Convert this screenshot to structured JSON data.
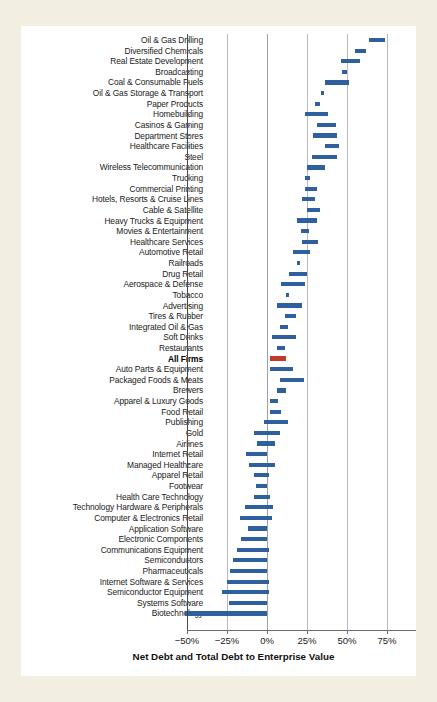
{
  "figure": {
    "background_color": "#f2efe2",
    "panel_color": "#ffffff",
    "bar_color": "#2e5f9e",
    "accent_color": "#c0392b",
    "gridline_color": "#b9b9c4"
  },
  "chart_data": {
    "type": "bar",
    "subtype": "horizontal-floating-range-bar",
    "title": "",
    "xlabel": "Net Debt and Total Debt to Enterprise Value",
    "ylabel": "",
    "xlim": [
      -57,
      80
    ],
    "xticks": [
      -50,
      -25,
      0,
      25,
      50,
      75
    ],
    "xticklabels": [
      "−50%",
      "−25%",
      "0%",
      "25%",
      "50%",
      "75%"
    ],
    "grid": "vertical",
    "legend": "none",
    "value_unit": "percent",
    "series": [
      {
        "name": "Net Debt to Enterprise Value",
        "role": "bar-start"
      },
      {
        "name": "Total Debt to Enterprise Value",
        "role": "bar-end"
      }
    ],
    "highlight_category": "All Firms",
    "categories": [
      "Oil & Gas Drilling",
      "Diversified Chemicals",
      "Real Estate Development",
      "Broadcasting",
      "Coal & Consumable Fuels",
      "Oil & Gas Storage & Transport",
      "Paper Products",
      "Homebuilding",
      "Casinos & Gaming",
      "Department Stores",
      "Healthcare Facilities",
      "Steel",
      "Wireless Telecommunication",
      "Trucking",
      "Commercial Printing",
      "Hotels, Resorts & Cruise Lines",
      "Cable & Satellite",
      "Heavy Trucks & Equipment",
      "Movies & Entertainment",
      "Healthcare Services",
      "Automotive Retail",
      "Railroads",
      "Drug Retail",
      "Aerospace & Defense",
      "Tobacco",
      "Advertising",
      "Tires & Rubber",
      "Integrated Oil & Gas",
      "Soft Drinks",
      "Restaurants",
      "All Firms",
      "Auto Parts & Equipment",
      "Packaged Foods & Meats",
      "Brewers",
      "Apparel & Luxury Goods",
      "Food Retail",
      "Publishing",
      "Gold",
      "Airlines",
      "Internet Retail",
      "Managed Healthcare",
      "Apparel Retail",
      "Footwear",
      "Health Care Technology",
      "Technology Hardware & Peripherals",
      "Computer & Electronics Retail",
      "Application Software",
      "Electronic Components",
      "Communications Equipment",
      "Semiconductors",
      "Pharmaceuticals",
      "Internet Software & Services",
      "Semiconductor Equipment",
      "Systems Software",
      "Biotechnology"
    ],
    "ranges": [
      {
        "category": "Oil & Gas Drilling",
        "start": 64,
        "end": 74
      },
      {
        "category": "Diversified Chemicals",
        "start": 55,
        "end": 62
      },
      {
        "category": "Real Estate Development",
        "start": 46,
        "end": 58
      },
      {
        "category": "Broadcasting",
        "start": 47,
        "end": 50
      },
      {
        "category": "Coal & Consumable Fuels",
        "start": 36,
        "end": 51
      },
      {
        "category": "Oil & Gas Storage & Transport",
        "start": 34,
        "end": 35
      },
      {
        "category": "Paper Products",
        "start": 30,
        "end": 33
      },
      {
        "category": "Homebuilding",
        "start": 24,
        "end": 38
      },
      {
        "category": "Casinos & Gaming",
        "start": 31,
        "end": 43
      },
      {
        "category": "Department Stores",
        "start": 29,
        "end": 44
      },
      {
        "category": "Healthcare Facilities",
        "start": 36,
        "end": 45
      },
      {
        "category": "Steel",
        "start": 28,
        "end": 44
      },
      {
        "category": "Wireless Telecommunication",
        "start": 25,
        "end": 36
      },
      {
        "category": "Trucking",
        "start": 24,
        "end": 27
      },
      {
        "category": "Commercial Printing",
        "start": 24,
        "end": 31
      },
      {
        "category": "Hotels, Resorts & Cruise Lines",
        "start": 22,
        "end": 30
      },
      {
        "category": "Cable & Satellite",
        "start": 25,
        "end": 33
      },
      {
        "category": "Heavy Trucks & Equipment",
        "start": 19,
        "end": 31
      },
      {
        "category": "Movies & Entertainment",
        "start": 21,
        "end": 26
      },
      {
        "category": "Healthcare Services",
        "start": 22,
        "end": 32
      },
      {
        "category": "Automotive Retail",
        "start": 16,
        "end": 27
      },
      {
        "category": "Railroads",
        "start": 19,
        "end": 20
      },
      {
        "category": "Drug Retail",
        "start": 14,
        "end": 25
      },
      {
        "category": "Aerospace & Defense",
        "start": 9,
        "end": 24
      },
      {
        "category": "Tobacco",
        "start": 12,
        "end": 14
      },
      {
        "category": "Advertising",
        "start": 6,
        "end": 22
      },
      {
        "category": "Tires & Rubber",
        "start": 11,
        "end": 18
      },
      {
        "category": "Integrated Oil & Gas",
        "start": 8,
        "end": 13
      },
      {
        "category": "Soft Drinks",
        "start": 3,
        "end": 18
      },
      {
        "category": "Restaurants",
        "start": 6,
        "end": 11
      },
      {
        "category": "All Firms",
        "start": 2,
        "end": 12
      },
      {
        "category": "Auto Parts & Equipment",
        "start": 2,
        "end": 16
      },
      {
        "category": "Packaged Foods & Meats",
        "start": 8,
        "end": 23
      },
      {
        "category": "Brewers",
        "start": 6,
        "end": 12
      },
      {
        "category": "Apparel & Luxury Goods",
        "start": 2,
        "end": 7
      },
      {
        "category": "Food Retail",
        "start": 2,
        "end": 9
      },
      {
        "category": "Publishing",
        "start": -2,
        "end": 13
      },
      {
        "category": "Gold",
        "start": -8,
        "end": 8
      },
      {
        "category": "Airlines",
        "start": -6,
        "end": 5
      },
      {
        "category": "Internet Retail",
        "start": -13,
        "end": 0
      },
      {
        "category": "Managed Healthcare",
        "start": -11,
        "end": 5
      },
      {
        "category": "Apparel Retail",
        "start": -8,
        "end": 1
      },
      {
        "category": "Footwear",
        "start": -7,
        "end": 0
      },
      {
        "category": "Health Care Technology",
        "start": -8,
        "end": 2
      },
      {
        "category": "Technology Hardware & Peripherals",
        "start": -14,
        "end": 4
      },
      {
        "category": "Computer & Electronics Retail",
        "start": -17,
        "end": 3
      },
      {
        "category": "Application Software",
        "start": -12,
        "end": 0
      },
      {
        "category": "Electronic Components",
        "start": -16,
        "end": 0
      },
      {
        "category": "Communications Equipment",
        "start": -19,
        "end": 1
      },
      {
        "category": "Semiconductors",
        "start": -21,
        "end": 0
      },
      {
        "category": "Pharmaceuticals",
        "start": -23,
        "end": 0
      },
      {
        "category": "Internet Software & Services",
        "start": -25,
        "end": 1
      },
      {
        "category": "Semiconductor Equipment",
        "start": -28,
        "end": 1
      },
      {
        "category": "Systems Software",
        "start": -24,
        "end": 0
      },
      {
        "category": "Biotechnology",
        "start": -51,
        "end": 0
      }
    ]
  }
}
